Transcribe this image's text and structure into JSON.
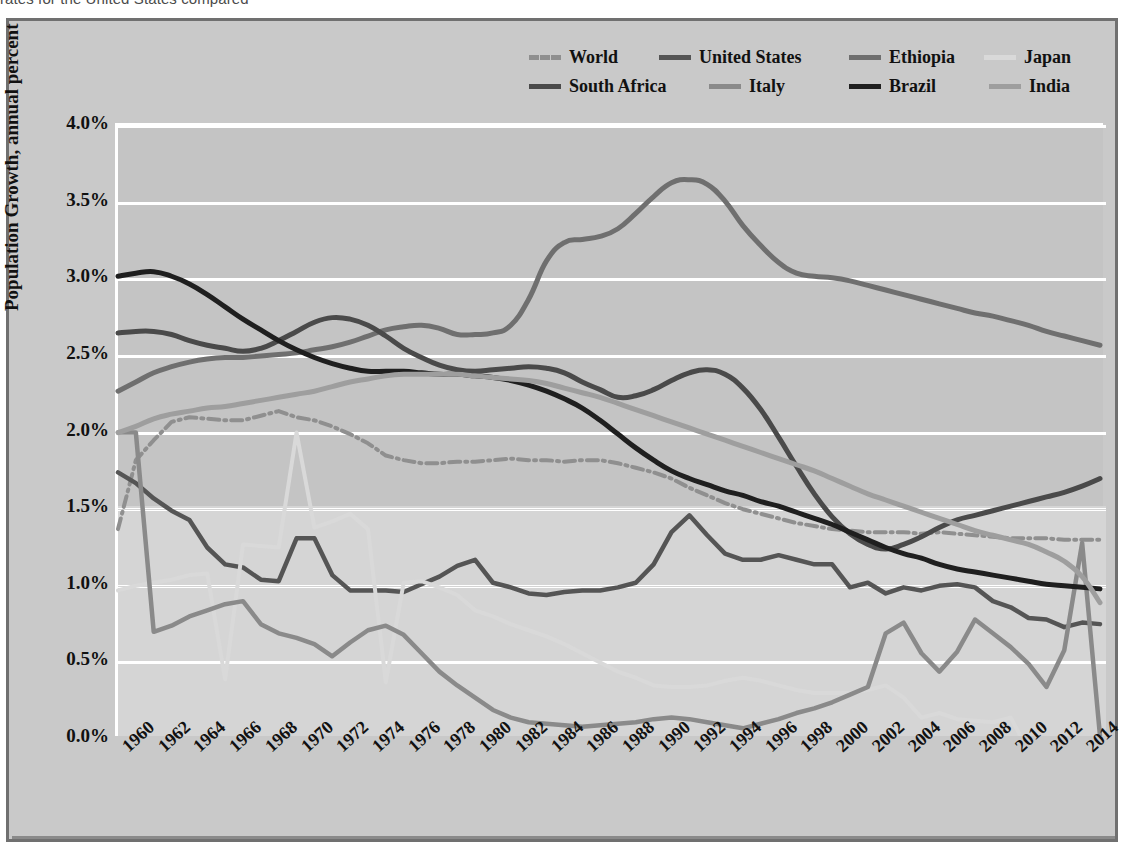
{
  "caption": {
    "prefix": "rates for the United States compared ",
    "full": "rates for the United States compared with other countries, by year, 1960-2015"
  },
  "axes": {
    "y_title": "Population Growth, annual percent",
    "y_ticks": [
      "0.0%",
      "0.5%",
      "1.0%",
      "1.5%",
      "2.0%",
      "2.5%",
      "3.0%",
      "3.5%",
      "4.0%"
    ],
    "x_ticks": [
      "1960",
      "1962",
      "1964",
      "1966",
      "1968",
      "1970",
      "1972",
      "1974",
      "1976",
      "1978",
      "1980",
      "1982",
      "1984",
      "1986",
      "1988",
      "1990",
      "1992",
      "1994",
      "1996",
      "1998",
      "2000",
      "2002",
      "2004",
      "2006",
      "2008",
      "2010",
      "2012",
      "2014"
    ]
  },
  "legend": {
    "row1": [
      {
        "name": "World",
        "color": "#8f8f8f",
        "style": "dashdot"
      },
      {
        "name": "United States",
        "color": "#555555",
        "style": "solid"
      },
      {
        "name": "Ethiopia",
        "color": "#6f6f6f",
        "style": "solid"
      },
      {
        "name": "Japan",
        "color": "#d9d9d9",
        "style": "solid"
      }
    ],
    "row2": [
      {
        "name": "South Africa",
        "color": "#4a4a4a",
        "style": "solid"
      },
      {
        "name": "Italy",
        "color": "#8a8a8a",
        "style": "solid"
      },
      {
        "name": "Brazil",
        "color": "#1f1f1f",
        "style": "solid"
      },
      {
        "name": "India",
        "color": "#9e9e9e",
        "style": "solid"
      }
    ]
  },
  "chart_data": {
    "type": "line",
    "title": "",
    "xlabel": "",
    "ylabel": "Population Growth, annual percent",
    "ylim": [
      0.0,
      4.0
    ],
    "xlim": [
      1960,
      2015
    ],
    "grid": true,
    "legend_position": "top-right",
    "x": [
      1960,
      1961,
      1962,
      1963,
      1964,
      1965,
      1966,
      1967,
      1968,
      1969,
      1970,
      1971,
      1972,
      1973,
      1974,
      1975,
      1976,
      1977,
      1978,
      1979,
      1980,
      1981,
      1982,
      1983,
      1984,
      1985,
      1986,
      1987,
      1988,
      1989,
      1990,
      1991,
      1992,
      1993,
      1994,
      1995,
      1996,
      1997,
      1998,
      1999,
      2000,
      2001,
      2002,
      2003,
      2004,
      2005,
      2006,
      2007,
      2008,
      2009,
      2010,
      2011,
      2012,
      2013,
      2014,
      2015
    ],
    "series": [
      {
        "name": "World",
        "color": "#8f8f8f",
        "style": "dashdot",
        "values": [
          1.35,
          1.8,
          1.93,
          2.05,
          2.08,
          2.07,
          2.06,
          2.06,
          2.09,
          2.12,
          2.08,
          2.06,
          2.02,
          1.97,
          1.91,
          1.83,
          1.8,
          1.78,
          1.78,
          1.79,
          1.79,
          1.8,
          1.81,
          1.8,
          1.8,
          1.79,
          1.8,
          1.8,
          1.78,
          1.75,
          1.72,
          1.68,
          1.62,
          1.57,
          1.52,
          1.48,
          1.45,
          1.42,
          1.39,
          1.37,
          1.35,
          1.34,
          1.33,
          1.33,
          1.33,
          1.32,
          1.33,
          1.32,
          1.31,
          1.3,
          1.29,
          1.29,
          1.29,
          1.28,
          1.28,
          1.28
        ]
      },
      {
        "name": "United States",
        "color": "#555555",
        "style": "solid",
        "values": [
          1.72,
          1.65,
          1.55,
          1.47,
          1.41,
          1.23,
          1.12,
          1.1,
          1.02,
          1.01,
          1.29,
          1.29,
          1.05,
          0.95,
          0.95,
          0.95,
          0.94,
          0.99,
          1.04,
          1.11,
          1.15,
          1.0,
          0.97,
          0.93,
          0.92,
          0.94,
          0.95,
          0.95,
          0.97,
          1.0,
          1.12,
          1.33,
          1.44,
          1.31,
          1.19,
          1.15,
          1.15,
          1.18,
          1.15,
          1.12,
          1.12,
          0.97,
          1.0,
          0.93,
          0.97,
          0.95,
          0.98,
          0.99,
          0.97,
          0.88,
          0.84,
          0.77,
          0.76,
          0.71,
          0.74,
          0.73
        ]
      },
      {
        "name": "Ethiopia",
        "color": "#6f6f6f",
        "style": "solid",
        "values": [
          2.25,
          2.31,
          2.37,
          2.41,
          2.44,
          2.46,
          2.47,
          2.47,
          2.48,
          2.49,
          2.5,
          2.52,
          2.54,
          2.57,
          2.61,
          2.65,
          2.67,
          2.68,
          2.66,
          2.62,
          2.62,
          2.63,
          2.68,
          2.85,
          3.1,
          3.22,
          3.24,
          3.26,
          3.31,
          3.41,
          3.52,
          3.61,
          3.63,
          3.6,
          3.49,
          3.33,
          3.2,
          3.09,
          3.02,
          3.0,
          2.99,
          2.97,
          2.94,
          2.91,
          2.88,
          2.85,
          2.82,
          2.79,
          2.76,
          2.74,
          2.71,
          2.68,
          2.64,
          2.61,
          2.58,
          2.55
        ]
      },
      {
        "name": "Japan",
        "color": "#d9d9d9",
        "style": "solid",
        "values": [
          0.95,
          0.98,
          1.0,
          1.02,
          1.05,
          1.06,
          0.37,
          1.25,
          1.24,
          1.23,
          1.98,
          1.36,
          1.4,
          1.45,
          1.35,
          0.35,
          1.0,
          1.01,
          0.97,
          0.92,
          0.82,
          0.78,
          0.73,
          0.69,
          0.65,
          0.6,
          0.54,
          0.48,
          0.42,
          0.38,
          0.33,
          0.32,
          0.32,
          0.33,
          0.36,
          0.38,
          0.36,
          0.33,
          0.3,
          0.28,
          0.28,
          0.28,
          0.3,
          0.33,
          0.25,
          0.12,
          0.15,
          0.11,
          0.1,
          0.09,
          0.12,
          -0.1,
          -0.12,
          -0.11,
          -0.1,
          -0.08
        ]
      },
      {
        "name": "South Africa",
        "color": "#4a4a4a",
        "style": "solid",
        "values": [
          2.63,
          2.64,
          2.64,
          2.62,
          2.58,
          2.55,
          2.53,
          2.51,
          2.53,
          2.58,
          2.64,
          2.7,
          2.73,
          2.72,
          2.68,
          2.61,
          2.53,
          2.47,
          2.42,
          2.39,
          2.38,
          2.39,
          2.4,
          2.41,
          2.4,
          2.37,
          2.31,
          2.26,
          2.21,
          2.22,
          2.26,
          2.32,
          2.37,
          2.39,
          2.36,
          2.27,
          2.13,
          1.95,
          1.76,
          1.58,
          1.43,
          1.32,
          1.25,
          1.22,
          1.25,
          1.3,
          1.36,
          1.41,
          1.44,
          1.47,
          1.5,
          1.53,
          1.56,
          1.59,
          1.63,
          1.68
        ]
      },
      {
        "name": "Italy",
        "color": "#8a8a8a",
        "style": "solid",
        "values": [
          1.98,
          1.98,
          0.68,
          0.72,
          0.78,
          0.82,
          0.86,
          0.88,
          0.73,
          0.67,
          0.64,
          0.6,
          0.52,
          0.61,
          0.69,
          0.72,
          0.66,
          0.54,
          0.42,
          0.33,
          0.25,
          0.17,
          0.12,
          0.09,
          0.08,
          0.07,
          0.06,
          0.07,
          0.08,
          0.09,
          0.11,
          0.12,
          0.11,
          0.09,
          0.07,
          0.05,
          0.08,
          0.11,
          0.15,
          0.18,
          0.22,
          0.27,
          0.32,
          0.67,
          0.74,
          0.54,
          0.42,
          0.55,
          0.76,
          0.67,
          0.58,
          0.47,
          0.32,
          0.56,
          1.26,
          0.0
        ]
      },
      {
        "name": "Brazil",
        "color": "#1f1f1f",
        "style": "solid",
        "values": [
          3.0,
          3.02,
          3.03,
          3.0,
          2.95,
          2.88,
          2.8,
          2.72,
          2.65,
          2.58,
          2.52,
          2.47,
          2.43,
          2.4,
          2.38,
          2.38,
          2.38,
          2.37,
          2.36,
          2.36,
          2.35,
          2.34,
          2.32,
          2.29,
          2.25,
          2.2,
          2.14,
          2.06,
          1.97,
          1.88,
          1.8,
          1.73,
          1.68,
          1.64,
          1.6,
          1.57,
          1.53,
          1.5,
          1.46,
          1.42,
          1.38,
          1.33,
          1.28,
          1.23,
          1.19,
          1.16,
          1.12,
          1.09,
          1.07,
          1.05,
          1.03,
          1.01,
          0.99,
          0.98,
          0.97,
          0.96
        ]
      },
      {
        "name": "India",
        "color": "#9e9e9e",
        "style": "solid",
        "values": [
          1.98,
          2.02,
          2.07,
          2.1,
          2.12,
          2.14,
          2.15,
          2.17,
          2.19,
          2.21,
          2.23,
          2.25,
          2.28,
          2.31,
          2.33,
          2.35,
          2.36,
          2.36,
          2.36,
          2.36,
          2.35,
          2.34,
          2.33,
          2.32,
          2.3,
          2.27,
          2.24,
          2.21,
          2.17,
          2.13,
          2.09,
          2.05,
          2.01,
          1.97,
          1.93,
          1.89,
          1.85,
          1.81,
          1.77,
          1.73,
          1.68,
          1.63,
          1.58,
          1.54,
          1.5,
          1.46,
          1.42,
          1.38,
          1.34,
          1.31,
          1.28,
          1.25,
          1.2,
          1.14,
          1.04,
          0.87
        ]
      }
    ]
  }
}
